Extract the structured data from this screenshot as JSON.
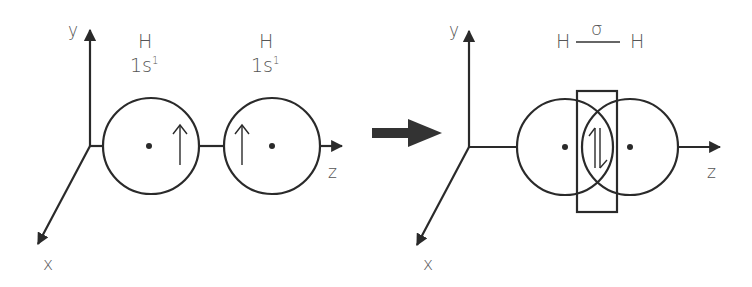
{
  "diagram": {
    "colors": {
      "stroke": "#2a2a2a",
      "text": "#555555",
      "background": "#ffffff"
    },
    "left_panel": {
      "axes": {
        "y_label": "y",
        "x_label": "x",
        "z_label": "z"
      },
      "atoms": [
        {
          "symbol": "H",
          "config": "1s",
          "superscript": "1",
          "spin": "↑"
        },
        {
          "symbol": "H",
          "config": "1s",
          "superscript": "1",
          "spin": "↑"
        }
      ]
    },
    "transition_arrow": "right-arrow",
    "right_panel": {
      "axes": {
        "y_label": "y",
        "x_label": "x",
        "z_label": "z"
      },
      "bond": {
        "left_atom": "H",
        "right_atom": "H",
        "bond_type": "σ"
      },
      "overlap_spins": "↑↓"
    }
  }
}
